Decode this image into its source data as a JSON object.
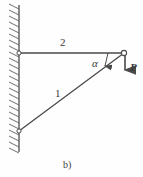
{
  "figure": {
    "caption": "b)",
    "background_color": "#fefefe",
    "line_color": "#4a4a4a",
    "label_color": "#3b3b3b",
    "labels": {
      "member_upper": "2",
      "member_lower": "1",
      "angle": "α",
      "force": "P"
    },
    "geometry": {
      "wall": {
        "x": 19,
        "y_top": 5,
        "y_bottom": 152,
        "hatch_width": 11
      },
      "support_upper": {
        "x": 19,
        "y": 53
      },
      "support_lower": {
        "x": 19,
        "y": 131
      },
      "node_right": {
        "x": 124,
        "y": 53
      },
      "member_2": {
        "from": [
          19,
          53
        ],
        "to": [
          124,
          53
        ]
      },
      "member_1": {
        "from": [
          19,
          131
        ],
        "to": [
          124,
          53
        ]
      },
      "force_arrow": {
        "from": [
          125,
          53
        ],
        "to": [
          125,
          73
        ],
        "direction": "down"
      },
      "angle_arc": {
        "vertex": [
          124,
          53
        ],
        "marker_x": 108,
        "from_y": 53,
        "to_y": 68
      }
    }
  }
}
